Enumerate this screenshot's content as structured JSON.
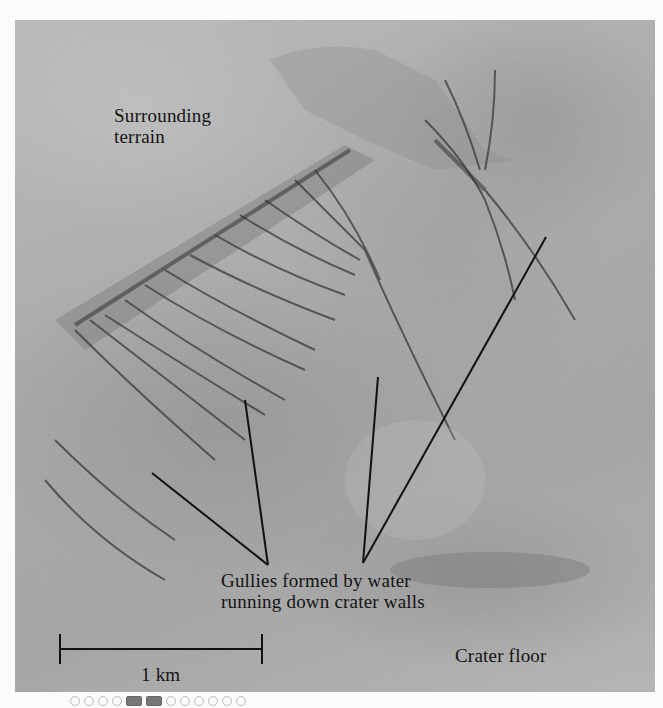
{
  "figure": {
    "labels": {
      "surrounding_terrain_line1": "Surrounding",
      "surrounding_terrain_line2": "terrain",
      "gullies_line1": "Gullies formed by water",
      "gullies_line2": "running down crater walls",
      "crater_floor": "Crater floor",
      "scale_bar": "1 km"
    },
    "colors": {
      "photo_gray": "#aaaaaa",
      "ink": "#141414",
      "background": "#fbfbfb"
    }
  }
}
